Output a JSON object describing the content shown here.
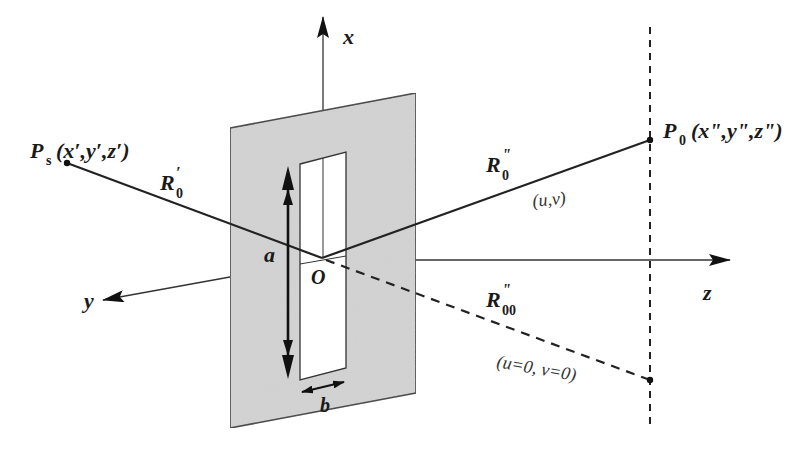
{
  "diagram": {
    "colors": {
      "screen_fill": "#d4d4d4",
      "line": "#222222",
      "background": "#ffffff"
    },
    "axes": {
      "x_label": "x",
      "y_label": "y",
      "z_label": "z"
    },
    "origin_label": "O",
    "slit": {
      "height_label": "a",
      "width_label": "b"
    },
    "source": {
      "symbol": "P",
      "subscript": "s",
      "coords": "(x′,y′,z′)"
    },
    "observation": {
      "symbol": "P",
      "subscript": "0",
      "coords": "(x\",y\",z\")"
    },
    "rays": {
      "incident": {
        "symbol": "R",
        "sub": "0",
        "prime": "′"
      },
      "diffracted": {
        "symbol": "R",
        "sub": "0",
        "prime": "\""
      },
      "central": {
        "symbol": "R",
        "sub": "00",
        "prime": "\""
      }
    },
    "point_labels": {
      "general": "(u,v)",
      "center": "(u=0, v=0)"
    }
  }
}
